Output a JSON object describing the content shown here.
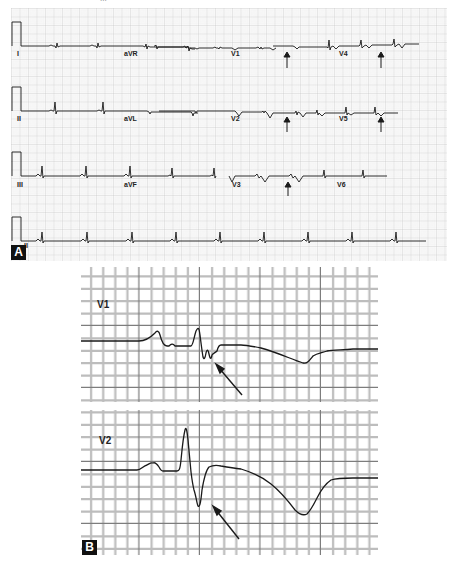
{
  "figure": {
    "caption_fragment": "...",
    "panels": [
      {
        "id": "A",
        "label": "A",
        "description": "12-lead ECG with rhythm strip; arrows mark T-wave inversions",
        "rows": [
          {
            "baseline_y": 38,
            "labels": [
              {
                "text": "I",
                "x": 6,
                "y": 41
              },
              {
                "text": "aVR",
                "x": 113,
                "y": 41
              },
              {
                "text": "V1",
                "x": 220,
                "y": 41
              },
              {
                "text": "V4",
                "x": 328,
                "y": 41
              }
            ],
            "arrows": [
              276,
              370
            ]
          },
          {
            "baseline_y": 103,
            "labels": [
              {
                "text": "II",
                "x": 6,
                "y": 106
              },
              {
                "text": "aVL",
                "x": 113,
                "y": 106
              },
              {
                "text": "V2",
                "x": 220,
                "y": 106
              },
              {
                "text": "V5",
                "x": 328,
                "y": 106
              }
            ],
            "arrows": [
              276,
              370
            ]
          },
          {
            "baseline_y": 168,
            "labels": [
              {
                "text": "III",
                "x": 6,
                "y": 171
              },
              {
                "text": "aVF",
                "x": 113,
                "y": 171
              },
              {
                "text": "V3",
                "x": 220,
                "y": 171
              },
              {
                "text": "V6",
                "x": 326,
                "y": 171
              }
            ],
            "arrows": [
              277
            ]
          },
          {
            "baseline_y": 233,
            "labels": [
              {
                "text": "II",
                "x": 13,
                "y": 232
              }
            ],
            "arrows": []
          }
        ]
      },
      {
        "id": "B",
        "label": "B",
        "description": "Magnified V1 and V2 complexes; arrows point to notched QRS / terminal deflection",
        "leads": [
          {
            "text": "V1"
          },
          {
            "text": "V2"
          }
        ]
      }
    ]
  },
  "colors": {
    "grid_minor": "#d4d4d4",
    "grid_major": "#a8a8a8",
    "trace": "#1a1a1a",
    "background": "#ffffff",
    "badge_bg": "#111111",
    "badge_fg": "#ffffff"
  }
}
